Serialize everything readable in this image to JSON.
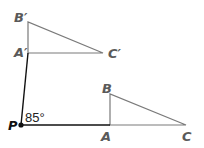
{
  "diagram": {
    "type": "rotation",
    "angle_label": "85°",
    "center": {
      "label": "P",
      "x": 21,
      "y": 125
    },
    "image_triangle": {
      "A_prime": {
        "label": "A′",
        "x": 28,
        "y": 53
      },
      "B_prime": {
        "label": "B′",
        "x": 28,
        "y": 22
      },
      "C_prime": {
        "label": "C′",
        "x": 103,
        "y": 53
      }
    },
    "preimage_triangle": {
      "A": {
        "label": "A",
        "x": 110,
        "y": 125
      },
      "B": {
        "label": "B",
        "x": 110,
        "y": 94
      },
      "C": {
        "label": "C",
        "x": 186,
        "y": 125
      }
    },
    "colors": {
      "triangle_stroke": "#7a7a7a",
      "ray_stroke": "#111111",
      "label": "#5a5a5a"
    }
  }
}
